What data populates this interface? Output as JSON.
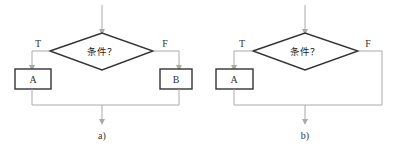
{
  "diagrams": [
    {
      "id": "a",
      "caption": "a)",
      "condition": "条件？",
      "true_label": "T",
      "false_label": "F",
      "true_branch": "A",
      "false_branch": "B"
    },
    {
      "id": "b",
      "caption": "b)",
      "condition": "条件？",
      "true_label": "T",
      "false_label": "F",
      "true_branch": "A",
      "false_branch": null
    }
  ]
}
